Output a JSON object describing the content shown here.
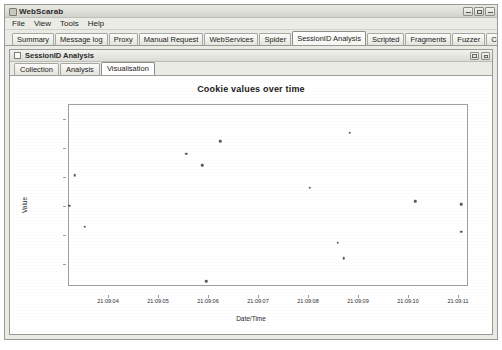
{
  "window": {
    "title": "WebScarab",
    "icon": "app-icon",
    "controls": [
      {
        "name": "minimize-button",
        "glyph": "minimize-icon"
      },
      {
        "name": "maximize-button",
        "glyph": "maximize-icon"
      },
      {
        "name": "close-button",
        "glyph": "close-icon"
      }
    ]
  },
  "menubar": {
    "items": [
      {
        "label": "File"
      },
      {
        "label": "View"
      },
      {
        "label": "Tools"
      },
      {
        "label": "Help"
      }
    ]
  },
  "tabs": {
    "active": "SessionID Analysis",
    "items": [
      {
        "label": "Summary"
      },
      {
        "label": "Message log"
      },
      {
        "label": "Proxy"
      },
      {
        "label": "Manual Request"
      },
      {
        "label": "WebServices"
      },
      {
        "label": "Spider"
      },
      {
        "label": "SessionID Analysis"
      },
      {
        "label": "Scripted"
      },
      {
        "label": "Fragments"
      },
      {
        "label": "Fuzzer"
      },
      {
        "label": "Compare"
      },
      {
        "label": "Search"
      }
    ]
  },
  "internal_frame": {
    "title": "SessionID Analysis",
    "controls": [
      {
        "name": "iframe-maximize-button",
        "glyph": "maximize-icon"
      },
      {
        "name": "iframe-restore-button",
        "glyph": "restore-icon"
      }
    ]
  },
  "subtabs": {
    "active": "Visualisation",
    "items": [
      {
        "label": "Collection"
      },
      {
        "label": "Analysis"
      },
      {
        "label": "Visualisation"
      }
    ]
  },
  "chart_data": {
    "type": "scatter",
    "title": "Cookie values over time",
    "xlabel": "Date/Time",
    "ylabel": "Value",
    "grid": false,
    "legend": false,
    "xticklabels": [
      "21:09:04",
      "21:09:05",
      "21:09:06",
      "21:09:07",
      "21:09:08",
      "21:09:09",
      "21:09:10",
      "21:09:11"
    ],
    "xtick_positions_pct": [
      10.0,
      22.5,
      35.0,
      47.5,
      60.0,
      72.5,
      85.0,
      97.5
    ],
    "yticklabels": [],
    "ytick_positions_pct": [
      8,
      24,
      40,
      56,
      72,
      88
    ],
    "points": [
      {
        "x_pct": 38.0,
        "y_pct": 20.0
      },
      {
        "x_pct": 70.5,
        "y_pct": 15.5
      },
      {
        "x_pct": 29.5,
        "y_pct": 27.0
      },
      {
        "x_pct": 33.5,
        "y_pct": 33.5
      },
      {
        "x_pct": 1.5,
        "y_pct": 39.0
      },
      {
        "x_pct": 0.0,
        "y_pct": 56.0
      },
      {
        "x_pct": 4.0,
        "y_pct": 67.5
      },
      {
        "x_pct": 60.5,
        "y_pct": 46.0
      },
      {
        "x_pct": 87.0,
        "y_pct": 53.5
      },
      {
        "x_pct": 98.5,
        "y_pct": 55.0
      },
      {
        "x_pct": 67.5,
        "y_pct": 76.5
      },
      {
        "x_pct": 69.0,
        "y_pct": 85.0
      },
      {
        "x_pct": 98.5,
        "y_pct": 70.5
      },
      {
        "x_pct": 34.5,
        "y_pct": 98.0
      }
    ],
    "marker_color": "#5b5b5b"
  }
}
